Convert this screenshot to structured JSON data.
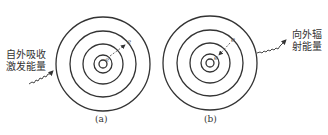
{
  "panels": [
    {
      "id": "a",
      "caption": "(a)",
      "energy_label_lines": [
        "自外吸收",
        "激发能量"
      ],
      "electron_labels": [
        "e",
        "e"
      ],
      "transition": "outward"
    },
    {
      "id": "b",
      "caption": "(b)",
      "energy_label_lines": [
        "向外辐",
        "射能量"
      ],
      "electron_labels": [
        "e",
        "e"
      ],
      "transition": "inward"
    }
  ],
  "colors": {
    "stroke": "#333333",
    "text": "#333333",
    "background": "#ffffff"
  }
}
